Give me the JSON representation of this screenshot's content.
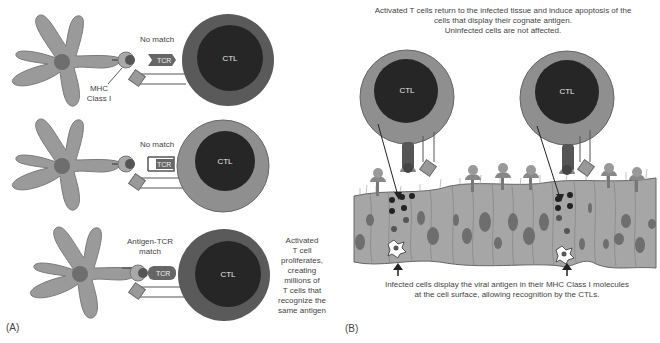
{
  "panel_a": {
    "label": "(A)",
    "rows": [
      {
        "status": "No match",
        "receptor": "TCR",
        "cell": "CTL"
      },
      {
        "status": "No match",
        "receptor": "TCR",
        "cell": "CTL"
      },
      {
        "status": "Antigen-TCR match",
        "status_line1": "Antigen-TCR",
        "status_line2": "match",
        "receptor": "TCR",
        "cell": "CTL"
      }
    ],
    "mhc_label_line1": "MHC",
    "mhc_label_line2": "Class I",
    "activation_note": [
      "Activated",
      "T cell",
      "proliferates,",
      "creating",
      "millions of",
      "T cells that",
      "recognize the",
      "same antigen"
    ]
  },
  "panel_b": {
    "label": "(B)",
    "top_caption": [
      "Activated T cells return to the infected tissue and induce apoptosis of the",
      "cells that display their cognate antigen.",
      "Uninfected cells are not affected."
    ],
    "cells": [
      "CTL",
      "CTL"
    ],
    "bottom_caption": [
      "Infected cells display the viral antigen in their MHC Class I molecules",
      "at the cell surface, allowing recognition by the CTLs."
    ]
  },
  "colors": {
    "ctl_outer_dark": "#5a5a5a",
    "ctl_outer_light": "#8f8f8f",
    "ctl_inner": "#262626",
    "dendritic": "#9a9a9a",
    "nucleus": "#6e6e6e",
    "tissue": "#a6a6a6"
  }
}
